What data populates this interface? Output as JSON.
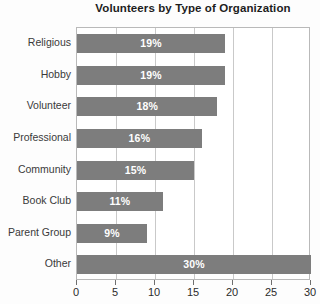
{
  "chart_data": {
    "type": "bar",
    "orientation": "horizontal",
    "title": "Volunteers by Type of Organization",
    "xlabel": "",
    "ylabel": "",
    "categories": [
      "Religious",
      "Hobby",
      "Volunteer",
      "Professional",
      "Community",
      "Book Club",
      "Parent Group",
      "Other"
    ],
    "values": [
      19,
      19,
      18,
      16,
      15,
      11,
      9,
      30
    ],
    "data_labels": [
      "19%",
      "19%",
      "18%",
      "16%",
      "15%",
      "11%",
      "9%",
      "30%"
    ],
    "xlim": [
      0,
      30
    ],
    "xticks": [
      0,
      5,
      10,
      15,
      20,
      25,
      30
    ],
    "xtick_labels": [
      "0",
      "5",
      "10",
      "15",
      "20",
      "25",
      "30"
    ],
    "grid": true,
    "legend": false,
    "bar_color": "#7d7d7d",
    "label_color": "#ffffff",
    "title_color": "#1d1d1d",
    "axis_color": "#2b2b2b"
  }
}
